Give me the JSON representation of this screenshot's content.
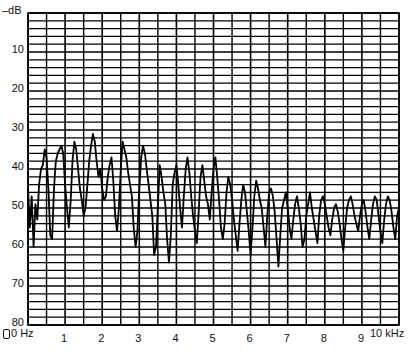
{
  "chart_data": {
    "type": "line",
    "title": "",
    "xlabel": "Hz / kHz",
    "ylabel": "-dB",
    "y_unit_label": "–dB",
    "xlim": [
      0,
      10
    ],
    "ylim": [
      0,
      80
    ],
    "y_inverted": true,
    "grid": true,
    "grid_minor_x_step": 0.5,
    "grid_minor_y_step": 2,
    "y_ticks": [
      {
        "value": 10,
        "label": "10"
      },
      {
        "value": 20,
        "label": "20"
      },
      {
        "value": 30,
        "label": "30"
      },
      {
        "value": 40,
        "label": "40"
      },
      {
        "value": 50,
        "label": "50"
      },
      {
        "value": 60,
        "label": "60"
      },
      {
        "value": 70,
        "label": "70"
      },
      {
        "value": 80,
        "label": "80"
      }
    ],
    "x_ticks": [
      {
        "value": 0,
        "label": "0 Hz"
      },
      {
        "value": 1,
        "label": "1"
      },
      {
        "value": 2,
        "label": "2"
      },
      {
        "value": 3,
        "label": "3"
      },
      {
        "value": 4,
        "label": "4"
      },
      {
        "value": 5,
        "label": "5"
      },
      {
        "value": 6,
        "label": "6"
      },
      {
        "value": 7,
        "label": "7"
      },
      {
        "value": 8,
        "label": "8"
      },
      {
        "value": 9,
        "label": "9"
      },
      {
        "value": 10,
        "label": "10 kHz"
      }
    ],
    "legend": [],
    "series": [
      {
        "name": "spectrum",
        "x": [
          0.0,
          0.05,
          0.1,
          0.15,
          0.2,
          0.25,
          0.3,
          0.35,
          0.4,
          0.45,
          0.5,
          0.55,
          0.6,
          0.65,
          0.7,
          0.75,
          0.8,
          0.85,
          0.9,
          0.95,
          1.0,
          1.05,
          1.1,
          1.15,
          1.2,
          1.25,
          1.3,
          1.35,
          1.4,
          1.45,
          1.5,
          1.55,
          1.6,
          1.65,
          1.7,
          1.75,
          1.8,
          1.85,
          1.9,
          1.95,
          2.0,
          2.05,
          2.1,
          2.15,
          2.2,
          2.25,
          2.3,
          2.35,
          2.4,
          2.45,
          2.5,
          2.55,
          2.6,
          2.65,
          2.7,
          2.75,
          2.8,
          2.85,
          2.9,
          2.95,
          3.0,
          3.05,
          3.1,
          3.15,
          3.2,
          3.25,
          3.3,
          3.35,
          3.4,
          3.45,
          3.5,
          3.55,
          3.6,
          3.65,
          3.7,
          3.75,
          3.8,
          3.85,
          3.9,
          3.95,
          4.0,
          4.05,
          4.1,
          4.15,
          4.2,
          4.25,
          4.3,
          4.35,
          4.4,
          4.45,
          4.5,
          4.55,
          4.6,
          4.65,
          4.7,
          4.75,
          4.8,
          4.85,
          4.9,
          4.95,
          5.0,
          5.05,
          5.1,
          5.15,
          5.2,
          5.25,
          5.3,
          5.35,
          5.4,
          5.45,
          5.5,
          5.55,
          5.6,
          5.65,
          5.7,
          5.75,
          5.8,
          5.85,
          5.9,
          5.95,
          6.0,
          6.05,
          6.1,
          6.15,
          6.2,
          6.25,
          6.3,
          6.35,
          6.4,
          6.45,
          6.5,
          6.55,
          6.6,
          6.65,
          6.7,
          6.75,
          6.8,
          6.85,
          6.9,
          6.95,
          7.0,
          7.05,
          7.1,
          7.15,
          7.2,
          7.25,
          7.3,
          7.35,
          7.4,
          7.45,
          7.5,
          7.55,
          7.6,
          7.65,
          7.7,
          7.75,
          7.8,
          7.85,
          7.9,
          7.95,
          8.0,
          8.05,
          8.1,
          8.15,
          8.2,
          8.25,
          8.3,
          8.35,
          8.4,
          8.45,
          8.5,
          8.55,
          8.6,
          8.65,
          8.7,
          8.75,
          8.8,
          8.85,
          8.9,
          8.95,
          9.0,
          9.05,
          9.1,
          9.15,
          9.2,
          9.25,
          9.3,
          9.35,
          9.4,
          9.45,
          9.5,
          9.55,
          9.6,
          9.65,
          9.7,
          9.75,
          9.8,
          9.85,
          9.9,
          9.95,
          10.0
        ],
        "values": [
          45,
          55,
          47,
          60,
          49,
          53,
          44,
          40,
          39,
          35,
          37,
          45,
          57,
          58,
          45,
          38,
          36,
          35,
          34,
          36,
          44,
          50,
          55,
          48,
          38,
          33,
          35,
          40,
          45,
          48,
          52,
          50,
          44,
          38,
          34,
          31,
          33,
          38,
          42,
          40,
          45,
          48,
          47,
          42,
          39,
          37,
          43,
          52,
          56,
          50,
          40,
          33,
          35,
          37,
          41,
          44,
          47,
          55,
          60,
          56,
          45,
          37,
          34,
          36,
          40,
          44,
          48,
          52,
          62,
          60,
          50,
          39,
          42,
          46,
          49,
          58,
          64,
          57,
          44,
          41,
          39,
          44,
          50,
          55,
          47,
          40,
          37,
          41,
          47,
          52,
          56,
          59,
          51,
          42,
          39,
          43,
          47,
          49,
          53,
          46,
          40,
          37,
          42,
          48,
          55,
          58,
          54,
          46,
          42,
          44,
          48,
          53,
          57,
          61,
          54,
          48,
          44,
          46,
          51,
          56,
          62,
          55,
          47,
          43,
          45,
          48,
          50,
          55,
          60,
          52,
          46,
          45,
          47,
          51,
          58,
          65,
          57,
          50,
          48,
          46,
          50,
          55,
          58,
          53,
          49,
          47,
          50,
          54,
          60,
          58,
          52,
          49,
          46,
          50,
          53,
          56,
          59,
          52,
          48,
          47,
          49,
          52,
          55,
          57,
          53,
          50,
          49,
          51,
          54,
          58,
          61,
          55,
          50,
          48,
          47,
          49,
          52,
          54,
          56,
          52,
          49,
          48,
          51,
          55,
          58,
          53,
          49,
          47,
          48,
          52,
          56,
          59,
          53,
          49,
          47,
          48,
          51,
          55,
          58,
          52,
          50
        ]
      }
    ]
  }
}
